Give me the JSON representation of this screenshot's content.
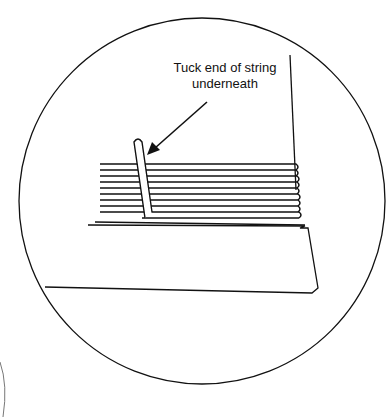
{
  "diagram": {
    "annotation": {
      "line1": "Tuck end of string",
      "line2": "underneath"
    },
    "colors": {
      "stroke": "#111111",
      "background": "#ffffff"
    },
    "string_wraps": 10
  }
}
